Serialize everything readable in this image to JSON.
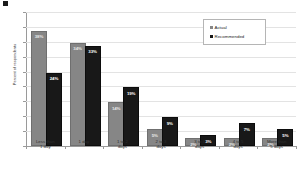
{
  "corner_mark": "artifact-mark",
  "chart_data": {
    "type": "bar",
    "title": "",
    "subtitle": "",
    "xlabel": "",
    "ylabel": "Percent of respondents",
    "ylim": [
      0,
      45
    ],
    "ytick_labels": [
      "45%",
      "40%",
      "35%",
      "30%",
      "25%",
      "20%",
      "15%",
      "10%",
      "5%",
      "0%"
    ],
    "ytick_values": [
      45,
      40,
      35,
      30,
      25,
      20,
      15,
      10,
      5,
      0
    ],
    "grid": true,
    "legend_position": "top-right",
    "categories": [
      "Less than\n1 day",
      "1 day",
      "1 to 2\ndays",
      "2 to 3\ndays",
      "3 to 4\ndays",
      "4 to 5\ndays",
      "More than\n5 days"
    ],
    "category_lines": [
      [
        "Less than",
        "1 day"
      ],
      [
        "1 day",
        ""
      ],
      [
        "1 to 2",
        "days"
      ],
      [
        "2 to 3",
        "days"
      ],
      [
        "3 to 4",
        "days"
      ],
      [
        "4 to 5",
        "days"
      ],
      [
        "More than",
        "5 days"
      ]
    ],
    "series": [
      {
        "name": "Actual",
        "color": "#868686",
        "values": [
          38,
          34,
          14,
          5,
          2,
          2,
          2
        ],
        "labels": [
          "38%",
          "34%",
          "14%",
          "5%",
          "2%",
          "2%",
          "2%"
        ]
      },
      {
        "name": "Recommended",
        "color": "#181818",
        "values": [
          24,
          33,
          19,
          9,
          3,
          7,
          5
        ],
        "labels": [
          "24%",
          "33%",
          "19%",
          "9%",
          "3%",
          "7%",
          "5%"
        ]
      }
    ]
  },
  "legend": {
    "entries": [
      {
        "label": "Actual"
      },
      {
        "label": "Recommended"
      }
    ]
  }
}
